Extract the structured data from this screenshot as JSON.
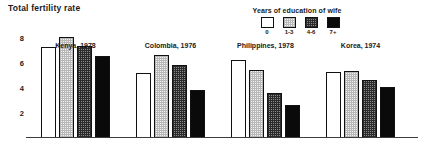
{
  "chart_data": {
    "type": "bar",
    "title": "Total fertility rate",
    "xlabel": "",
    "ylabel": "",
    "ylim": [
      0,
      8.8
    ],
    "grid": false,
    "yticks": [
      8,
      6,
      4,
      2
    ],
    "legend_position": "top-right",
    "legend_title": "Years of education of wife",
    "categories": [
      "Kenya, 1978",
      "Colombia, 1976",
      "Philippines, 1978",
      "Korea, 1974"
    ],
    "series": [
      {
        "name": "0",
        "swatch": "white",
        "color": "#ffffff",
        "values": [
          7.2,
          5.1,
          6.2,
          5.2
        ]
      },
      {
        "name": "1-3",
        "swatch": "light-stipple",
        "color": "#f2f2f2",
        "values": [
          8.0,
          6.6,
          5.4,
          5.3
        ]
      },
      {
        "name": "4-6",
        "swatch": "dark-stipple",
        "color": "#8c8c8c",
        "values": [
          7.3,
          5.8,
          3.5,
          4.6
        ]
      },
      {
        "name": "7+",
        "swatch": "black",
        "color": "#0a0a0a",
        "values": [
          6.5,
          3.8,
          2.6,
          4.0
        ]
      }
    ],
    "annotations": []
  },
  "legend": {
    "title": "Years of education of wife",
    "items": [
      {
        "label": "0"
      },
      {
        "label": "1-3"
      },
      {
        "label": "4-6"
      },
      {
        "label": "7+"
      }
    ]
  },
  "axis": {
    "yticks": [
      "8",
      "6",
      "4",
      "2"
    ]
  },
  "groups": [
    {
      "label": "Kenya, 1978"
    },
    {
      "label": "Colombia, 1976"
    },
    {
      "label": "Philippines, 1978"
    },
    {
      "label": "Korea, 1974"
    }
  ]
}
